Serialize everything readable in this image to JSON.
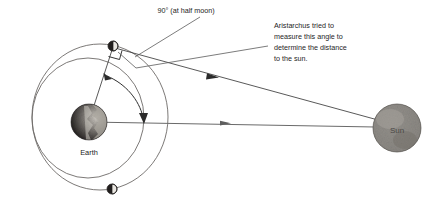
{
  "figure": {
    "type": "astronomy-diagram",
    "background_color": "#ffffff",
    "width": 437,
    "height": 205
  },
  "annotations": {
    "right_angle": {
      "text": "90° (at half moon)",
      "value": "90°",
      "condition": "at half moon"
    },
    "explanation": {
      "lines": [
        "Aristarchus tried to",
        "measure this angle to",
        "determine the distance",
        "to the sun."
      ],
      "line1": "Aristarchus tried to",
      "line2": "measure this angle to",
      "line3": "determine the distance",
      "line4": "to the sun."
    }
  },
  "bodies": {
    "earth": {
      "label": "Earth",
      "color_dark": "#231f20",
      "color_light": "#b8b4ad",
      "cx": 89,
      "cy": 122,
      "r": 18
    },
    "sun": {
      "label": "Sun",
      "color": "#8e8b86",
      "cx": 397,
      "cy": 128,
      "r": 24
    },
    "moon_top": {
      "label": "",
      "phase": "half moon",
      "cx": 113,
      "cy": 46,
      "r": 5
    },
    "moon_bottom": {
      "label": "",
      "phase": "half moon",
      "cx": 112,
      "cy": 189,
      "r": 5
    }
  },
  "orbit": {
    "name": "moon-orbit",
    "stroke_color": "#6d6a68",
    "outer": {
      "cx": 100,
      "cy": 117,
      "rx": 68,
      "ry": 73
    },
    "inner": {
      "cx": 88,
      "cy": 118,
      "rx": 56,
      "ry": 60
    }
  },
  "rays": {
    "earth_to_sun": {
      "name": "earth-sun-line",
      "from": "Earth",
      "to": "Sun"
    },
    "moon_to_sun": {
      "name": "moon-sun-line",
      "from": "Moon",
      "to": "Sun"
    },
    "earth_to_moon": {
      "name": "earth-moon-line",
      "from": "Earth",
      "to": "Moon"
    }
  },
  "measured_angle": {
    "name": "sun-earth-moon-angle",
    "description": "angle at Earth between the Moon and the Sun",
    "marker": "double-headed arc"
  },
  "colors": {
    "line": "#3b3b3b",
    "orbit": "#6d6a68",
    "text": "#1b1b1b",
    "earth_dark": "#231f20",
    "sun": "#8e8b86"
  }
}
